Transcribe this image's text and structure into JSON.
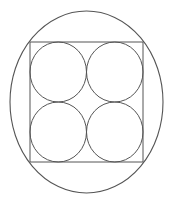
{
  "diagram": {
    "stroke_color": "#555555",
    "background": "#ffffff",
    "outer_ellipse": {
      "cx": 86.5,
      "cy": 102,
      "rx": 76.5,
      "ry": 91
    },
    "square": {
      "x": 30,
      "y": 42,
      "width": 113,
      "height": 120
    },
    "circles": [
      {
        "cx": 58.25,
        "cy": 72,
        "rx": 28.25,
        "ry": 30
      },
      {
        "cx": 114.75,
        "cy": 72,
        "rx": 28.25,
        "ry": 30
      },
      {
        "cx": 58.25,
        "cy": 132,
        "rx": 28.25,
        "ry": 30
      },
      {
        "cx": 114.75,
        "cy": 132,
        "rx": 28.25,
        "ry": 30
      }
    ]
  }
}
